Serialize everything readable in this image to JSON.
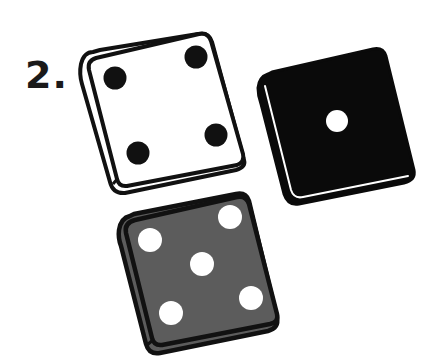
{
  "label": "2.",
  "colors": {
    "background": "#ffffff",
    "outline": "#111111",
    "white_die_face": "#ffffff",
    "black_die_face": "#0a0a0a",
    "gray_die_face": "#5c5c5c",
    "pip_dark": "#111111",
    "pip_light": "#ffffff"
  },
  "dice": [
    {
      "name": "white-die",
      "face_color": "white",
      "value": 4,
      "pip_color": "black"
    },
    {
      "name": "black-die",
      "face_color": "black",
      "value": 1,
      "pip_color": "white"
    },
    {
      "name": "gray-die",
      "face_color": "gray",
      "value": 5,
      "pip_color": "white"
    }
  ]
}
